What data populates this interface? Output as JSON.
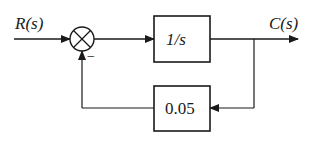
{
  "diagram": {
    "type": "feedback-control-block-diagram",
    "input_signal": "R(s)",
    "output_signal": "C(s)",
    "summing_junction": {
      "symbol": "⊗",
      "feedback_sign": "−"
    },
    "forward_block": {
      "label": "1/s"
    },
    "feedback_block": {
      "label": "0.05"
    },
    "colors": {
      "stroke": "#1a1a1a",
      "background": "#ffffff"
    }
  }
}
